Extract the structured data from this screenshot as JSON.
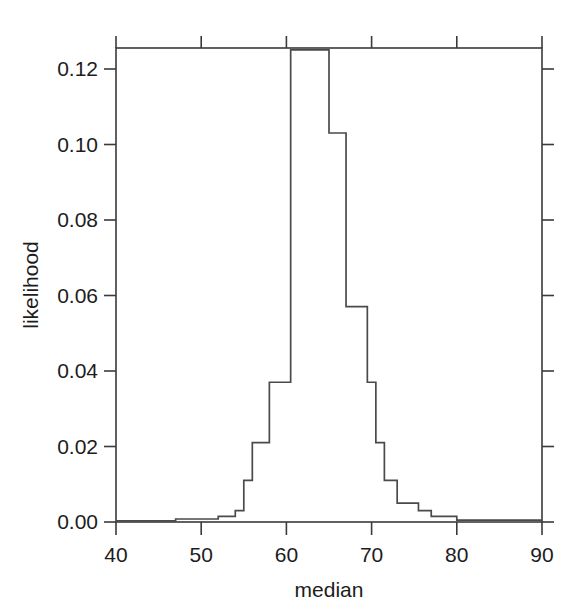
{
  "chart_data": {
    "type": "area",
    "title": "",
    "subtitle": "",
    "xlabel": "median",
    "ylabel": "likelihood",
    "xlim": [
      40,
      90
    ],
    "ylim": [
      0.0,
      0.1255
    ],
    "grid": false,
    "legend": null,
    "legend_position": "none",
    "style": "step-histogram outline, single series, black line on white background",
    "xticks": [
      40,
      50,
      60,
      70,
      80,
      90
    ],
    "xtick_labels": [
      "40",
      "50",
      "60",
      "70",
      "80",
      "90"
    ],
    "yticks": [
      0.0,
      0.02,
      0.04,
      0.06,
      0.08,
      0.1,
      0.12
    ],
    "ytick_labels": [
      "0.00",
      "0.02",
      "0.04",
      "0.06",
      "0.08",
      "0.10",
      "0.12"
    ],
    "series": [
      {
        "name": "likelihood",
        "bin_edges": [
          40,
          47,
          52,
          54,
          55,
          56,
          58,
          60.5,
          65,
          67,
          69.5,
          70.5,
          71.5,
          73,
          75.5,
          77,
          80,
          90
        ],
        "values": [
          0.0003,
          0.0008,
          0.0015,
          0.003,
          0.011,
          0.021,
          0.037,
          0.125,
          0.103,
          0.057,
          0.037,
          0.021,
          0.011,
          0.005,
          0.003,
          0.0015,
          0.0005
        ],
        "peak_value": 0.125,
        "peak_bin": [
          60.5,
          65
        ]
      }
    ],
    "colors": {
      "line": "#4a4a4a",
      "frame": "#3a3a3a",
      "text": "#1c1c1c",
      "background": "#ffffff"
    }
  },
  "axes": {
    "x_title": "median",
    "y_title": "likelihood"
  }
}
